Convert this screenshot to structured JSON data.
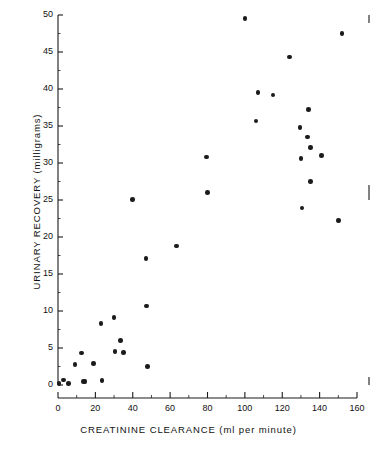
{
  "chart_data": {
    "type": "scatter",
    "title": "",
    "xlabel": "CREATININE  CLEARANCE (ml per minute)",
    "ylabel": "URINARY  RECOVERY  (milligrams)",
    "xlim": [
      0,
      160
    ],
    "ylim": [
      0,
      50
    ],
    "xticks": [
      0,
      20,
      40,
      60,
      80,
      100,
      120,
      140,
      160
    ],
    "yticks": [
      0,
      5,
      10,
      15,
      20,
      25,
      30,
      35,
      40,
      45,
      50
    ],
    "xtick_labels": [
      "0",
      "20",
      "40",
      "60",
      "80",
      "100",
      "120",
      "140",
      "160"
    ],
    "ytick_labels": [
      "0",
      "5",
      "10",
      "15",
      "20",
      "25",
      "30",
      "35",
      "40",
      "45",
      "50"
    ],
    "xminor_step": 10,
    "yminor_step": 2.5,
    "grid": false,
    "legend": false,
    "marker": "filled-circle",
    "marker_color": "#1b1b1b",
    "series": [
      {
        "name": "patients",
        "points": [
          [
            0.5,
            0.2
          ],
          [
            3.0,
            0.7
          ],
          [
            5.5,
            0.2
          ],
          [
            9.0,
            2.8
          ],
          [
            12.5,
            4.3
          ],
          [
            13.5,
            0.5
          ],
          [
            14.5,
            0.5
          ],
          [
            19.0,
            2.9
          ],
          [
            23.0,
            8.3
          ],
          [
            23.5,
            0.6
          ],
          [
            30.0,
            9.1
          ],
          [
            30.5,
            4.5
          ],
          [
            33.5,
            6.0
          ],
          [
            35.0,
            4.4
          ],
          [
            40.0,
            25.1
          ],
          [
            47.0,
            17.1
          ],
          [
            47.5,
            10.7
          ],
          [
            48.0,
            2.5
          ],
          [
            63.5,
            18.8
          ],
          [
            79.5,
            30.8
          ],
          [
            80.0,
            26.0
          ],
          [
            100.0,
            49.5
          ],
          [
            106.0,
            35.7
          ],
          [
            107.0,
            39.5
          ],
          [
            115.0,
            39.2
          ],
          [
            124.0,
            44.3
          ],
          [
            129.5,
            34.8
          ],
          [
            130.0,
            30.6
          ],
          [
            130.5,
            23.9
          ],
          [
            133.5,
            33.5
          ],
          [
            134.0,
            37.2
          ],
          [
            135.0,
            32.1
          ],
          [
            135.0,
            27.5
          ],
          [
            141.0,
            31.0
          ],
          [
            150.0,
            22.2
          ],
          [
            152.0,
            47.5
          ]
        ]
      }
    ]
  },
  "axes": {
    "x_tick_labels": [
      "0",
      "20",
      "40",
      "60",
      "80",
      "100",
      "120",
      "140",
      "160"
    ],
    "y_tick_labels": [
      "0",
      "5",
      "10",
      "15",
      "20",
      "25",
      "30",
      "35",
      "40",
      "45",
      "50"
    ],
    "x_title": "CREATININE  CLEARANCE (ml per minute)",
    "y_title": "URINARY  RECOVERY  (milligrams)"
  }
}
